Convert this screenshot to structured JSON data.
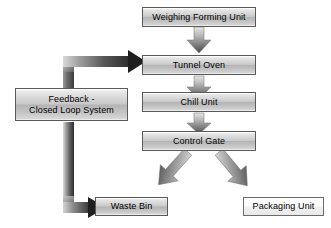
{
  "diagram": {
    "background_color": "#ffffff",
    "node_fill_gray": "#c9c9c9",
    "node_fill_light": "#ffffff",
    "node_border_color": "#5a5a5a",
    "arrow_color": "#4a4a4a",
    "text_color": "#000000"
  },
  "nodes": {
    "weighing_forming_unit": {
      "label": "Weighing Forming Unit",
      "style": "gray"
    },
    "tunnel_oven": {
      "label": "Tunnel Oven",
      "style": "gray"
    },
    "chill_unit": {
      "label": "Chill Unit",
      "style": "gray"
    },
    "control_gate": {
      "label": "Control Gate",
      "style": "gray"
    },
    "feedback": {
      "label": "Feedback -\nClosed Loop System",
      "style": "gray"
    },
    "waste_bin": {
      "label": "Waste Bin",
      "style": "gray"
    },
    "packaging_unit": {
      "label": "Packaging Unit",
      "style": "light"
    }
  },
  "connectors": [
    {
      "name": "weighing-to-tunnel-oven",
      "from": "weighing_forming_unit",
      "to": "tunnel_oven",
      "kind": "down-block-arrow"
    },
    {
      "name": "tunnel-oven-to-chill-unit",
      "from": "tunnel_oven",
      "to": "chill_unit",
      "kind": "down-block-arrow"
    },
    {
      "name": "chill-unit-to-control-gate",
      "from": "chill_unit",
      "to": "control_gate",
      "kind": "down-block-arrow"
    },
    {
      "name": "control-gate-to-waste-bin",
      "from": "control_gate",
      "to": "waste_bin",
      "kind": "diagonal-down-left-arrow"
    },
    {
      "name": "control-gate-to-packaging-unit",
      "from": "control_gate",
      "to": "packaging_unit",
      "kind": "diagonal-down-right-arrow"
    },
    {
      "name": "feedback-to-tunnel-oven",
      "from": "feedback",
      "to": "tunnel_oven",
      "kind": "elbow-up-right-arrow"
    },
    {
      "name": "feedback-to-waste-bin",
      "from": "feedback",
      "to": "waste_bin",
      "kind": "elbow-down-right-arrow"
    }
  ]
}
